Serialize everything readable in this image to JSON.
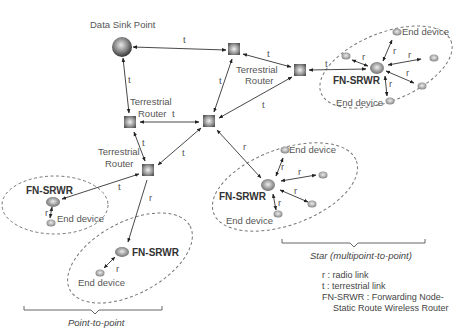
{
  "diagram": {
    "sink": {
      "label": "Data Sink Point"
    },
    "routers": [
      {
        "id": "A",
        "label": ""
      },
      {
        "id": "B",
        "label": "Terrestrial Router"
      },
      {
        "id": "C",
        "label": "Terrestrial Router"
      },
      {
        "id": "D",
        "label": ""
      },
      {
        "id": "E",
        "label": "Terrestrial Router"
      }
    ],
    "router_label_line1": "Terrestrial",
    "router_label_line2": "Router",
    "node_label": "FN-SRWR",
    "end_device_label": "End device",
    "link_t": "t",
    "link_r": "r",
    "groups": {
      "star": "Star (multipoint-to-point)",
      "p2p": "Point-to-point"
    },
    "legend": {
      "r": "r : radio link",
      "t": "t : terrestrial link",
      "fn1": "FN-SRWR : Forwarding Node-",
      "fn2": "Static Route Wireless Router"
    }
  }
}
